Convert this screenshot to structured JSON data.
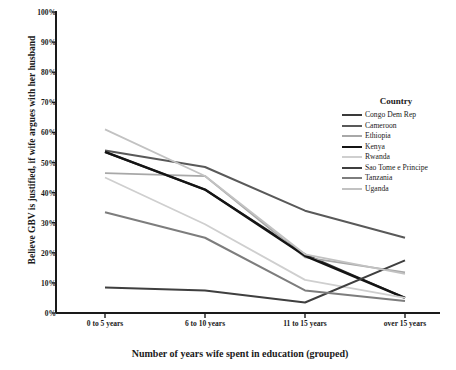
{
  "chart_data": {
    "type": "line",
    "title": "",
    "xlabel": "Number of years wife spent in education (grouped)",
    "ylabel": "Believe GBV is justified, if wife argues with her husband",
    "categories": [
      "0 to 5 years",
      "6 to 10 years",
      "11 to 15 years",
      "over 15 years"
    ],
    "ylim": [
      0,
      100
    ],
    "ytick_labels": [
      "0%",
      "10%",
      "20%",
      "30%",
      "40%",
      "50%",
      "60%",
      "70%",
      "80%",
      "90%",
      "100%"
    ],
    "ytick_values": [
      0,
      10,
      20,
      30,
      40,
      50,
      60,
      70,
      80,
      90,
      100
    ],
    "grid": false,
    "legend_position": "right",
    "legend_title": "Country",
    "series": [
      {
        "name": "Congo Dem Rep",
        "values": [
          53.5,
          41.0,
          19.5,
          5.0
        ],
        "color": "#3a3a3a",
        "width": 2.0
      },
      {
        "name": "Cameroon",
        "values": [
          54.0,
          48.5,
          34.0,
          25.0
        ],
        "color": "#595959",
        "width": 2.0
      },
      {
        "name": "Ethiopia",
        "values": [
          46.5,
          45.5,
          18.5,
          13.5
        ],
        "color": "#a8a8a8",
        "width": 1.8
      },
      {
        "name": "Kenya",
        "values": [
          53.5,
          41.0,
          19.0,
          5.0
        ],
        "color": "#141414",
        "width": 2.4
      },
      {
        "name": "Rwanda",
        "values": [
          45.0,
          29.5,
          11.0,
          5.0
        ],
        "color": "#cfcfcf",
        "width": 1.8
      },
      {
        "name": "Sao Tome e Principe",
        "values": [
          8.5,
          7.5,
          3.5,
          17.5
        ],
        "color": "#3f3f3f",
        "width": 2.0
      },
      {
        "name": "Tanzania",
        "values": [
          33.5,
          25.0,
          7.5,
          4.0
        ],
        "color": "#7d7d7d",
        "width": 2.0
      },
      {
        "name": "Uganda",
        "values": [
          61.0,
          45.5,
          19.5,
          13.0
        ],
        "color": "#c2c2c2",
        "width": 1.8
      }
    ]
  },
  "axis": {
    "y_title": "Believe GBV is justified, if wife argues with her husband",
    "x_title": "Number of years wife spent in education (grouped)"
  }
}
